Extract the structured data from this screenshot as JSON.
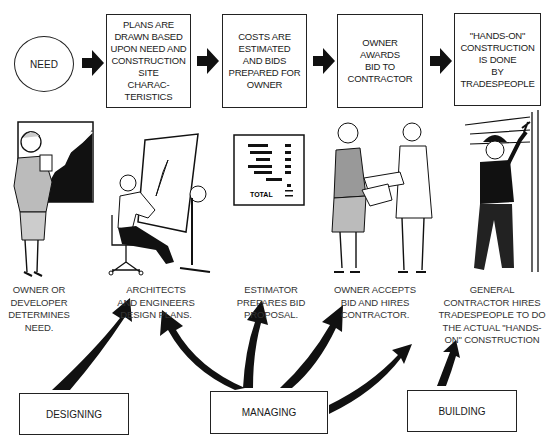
{
  "flow": {
    "start": {
      "label": "NEED"
    },
    "steps": [
      {
        "label": "PLANS ARE\nDRAWN BASED\nUPON NEED AND\nCONSTRUCTION\nSITE\nCHARAC-\nTERISTICS"
      },
      {
        "label": "COSTS ARE\nESTIMATED\nAND BIDS\nPREPARED FOR\nOWNER"
      },
      {
        "label": "OWNER\nAWARDS\nBID TO\nCONTRACTOR"
      },
      {
        "label": "\"HANDS-ON\"\nCONSTRUCTION\nIS DONE\nBY\nTRADESPEOPLE"
      }
    ]
  },
  "illustrations": [
    {
      "name": "owner-at-chart",
      "caption": "OWNER OR\nDEVELOPER\nDETERMINES\nNEED."
    },
    {
      "name": "architect-at-drafting-table",
      "caption": "ARCHITECTS\nAND ENGINEERS\nDESIGN PLANS."
    },
    {
      "name": "bid-proposal-sheet",
      "caption": "ESTIMATOR\nPREPARES BID\nPROPOSAL.",
      "sheet_total_label": "TOTAL"
    },
    {
      "name": "handshake",
      "caption": "OWNER ACCEPTS\nBID AND HIRES\nCONTRACTOR."
    },
    {
      "name": "tradesperson-hammering",
      "caption": "GENERAL\nCONTRACTOR HIRES\nTRADESPEOPLE TO DO\nTHE ACTUAL \"HANDS-\nON\" CONSTRUCTION"
    }
  ],
  "roles": [
    {
      "label": "DESIGNING"
    },
    {
      "label": "MANAGING"
    },
    {
      "label": "BUILDING"
    }
  ]
}
